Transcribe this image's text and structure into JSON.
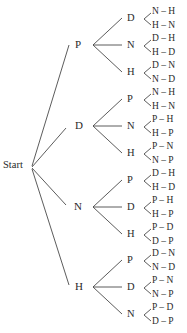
{
  "diagram": {
    "type": "tree",
    "root": "Start",
    "colors": {
      "line": "#4a4a4a",
      "text": "#2a2a2a",
      "background": "#ffffff"
    },
    "branches": [
      {
        "label": "P",
        "children": [
          {
            "label": "D",
            "leaves": [
              "N – H",
              "H – N"
            ]
          },
          {
            "label": "N",
            "leaves": [
              "D – H",
              "H – D"
            ]
          },
          {
            "label": "H",
            "leaves": [
              "D – N",
              "N – D"
            ]
          }
        ]
      },
      {
        "label": "D",
        "children": [
          {
            "label": "P",
            "leaves": [
              "N – H",
              "H – N"
            ]
          },
          {
            "label": "N",
            "leaves": [
              "P – H",
              "H – P"
            ]
          },
          {
            "label": "H",
            "leaves": [
              "P – N",
              "N – P"
            ]
          }
        ]
      },
      {
        "label": "N",
        "children": [
          {
            "label": "P",
            "leaves": [
              "D – H",
              "H – D"
            ]
          },
          {
            "label": "D",
            "leaves": [
              "P – H",
              "H – P"
            ]
          },
          {
            "label": "H",
            "leaves": [
              "P – D",
              "D – P"
            ]
          }
        ]
      },
      {
        "label": "H",
        "children": [
          {
            "label": "P",
            "leaves": [
              "D – N",
              "N – D"
            ]
          },
          {
            "label": "D",
            "leaves": [
              "P – N",
              "N – P"
            ]
          },
          {
            "label": "N",
            "leaves": [
              "P – D",
              "D – P"
            ]
          }
        ]
      }
    ]
  }
}
